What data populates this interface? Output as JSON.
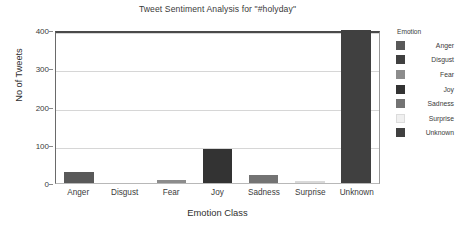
{
  "chart_data": {
    "type": "bar",
    "title": "Tweet Sentiment Analysis for \"#holyday\"",
    "xlabel": "Emotion Class",
    "ylabel": "No of Tweets",
    "categories": [
      "Anger",
      "Disgust",
      "Fear",
      "Joy",
      "Sadness",
      "Surprise",
      "Unknown"
    ],
    "values": [
      28,
      0,
      8,
      90,
      20,
      3,
      400
    ],
    "ylim": [
      0,
      400
    ],
    "yticks": [
      0,
      100,
      200,
      300,
      400
    ],
    "ytick_labels": [
      "0",
      "100",
      "200",
      "300",
      "400"
    ],
    "grid": "horizontal",
    "legend_position": "right",
    "legend_title": "Emotion",
    "series": [
      {
        "name": "Anger",
        "value": 28,
        "color": "#595959"
      },
      {
        "name": "Disgust",
        "value": 0,
        "color": "#404040"
      },
      {
        "name": "Fear",
        "value": 8,
        "color": "#8c8c8c"
      },
      {
        "name": "Joy",
        "value": 90,
        "color": "#333333"
      },
      {
        "name": "Sadness",
        "value": 20,
        "color": "#737373"
      },
      {
        "name": "Surprise",
        "value": 3,
        "color": "#f0f0f0"
      },
      {
        "name": "Unknown",
        "value": 400,
        "color": "#404040"
      }
    ]
  }
}
